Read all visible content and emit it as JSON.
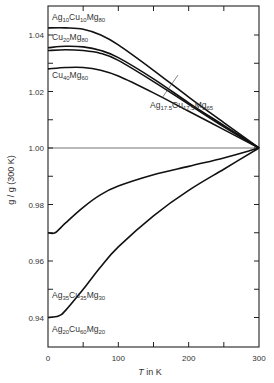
{
  "chart_data": {
    "type": "line",
    "title": "",
    "xlabel": "T in K",
    "ylabel": "g / g (300 K)",
    "xlim": [
      0,
      300
    ],
    "ylim": [
      0.93,
      1.045
    ],
    "x_ticks": [
      0,
      100,
      200,
      300
    ],
    "x_minor_ticks": [
      50,
      150,
      250
    ],
    "y_ticks": [
      0.94,
      0.96,
      0.98,
      1.0,
      1.02,
      1.04
    ],
    "y_minor_ticks": [
      0.95,
      0.97,
      0.99,
      1.01,
      1.03
    ],
    "reference_line": {
      "y": 1.0,
      "label": "g/g(300K) = 1"
    },
    "grid": false,
    "legend": "inline labels",
    "series": [
      {
        "name": "Ag10Cu10Mg80",
        "label_parts": [
          "Ag",
          "10",
          "Cu",
          "10",
          "Mg",
          "80"
        ],
        "x": [
          0,
          25,
          50,
          75,
          100,
          150,
          200,
          250,
          300
        ],
        "y": [
          1.0425,
          1.0425,
          1.042,
          1.04,
          1.0365,
          1.0275,
          1.018,
          1.009,
          1.0
        ]
      },
      {
        "name": "Cu20Mg80",
        "label_parts": [
          "Cu",
          "20",
          "Mg",
          "80"
        ],
        "x": [
          0,
          25,
          50,
          75,
          100,
          150,
          200,
          250,
          300
        ],
        "y": [
          1.0355,
          1.036,
          1.0358,
          1.0345,
          1.032,
          1.0245,
          1.016,
          1.008,
          1.0
        ]
      },
      {
        "name": "Ag17.5Cu17.5Mg65",
        "label_parts": [
          "Ag",
          "17.5",
          "Cu",
          "17.5",
          "Mg",
          "65"
        ],
        "x": [
          0,
          25,
          50,
          75,
          100,
          150,
          200,
          250,
          300
        ],
        "y": [
          1.0345,
          1.0348,
          1.0345,
          1.0335,
          1.031,
          1.0235,
          1.0155,
          1.0075,
          1.0
        ]
      },
      {
        "name": "Cu40Mg60",
        "label_parts": [
          "Cu",
          "40",
          "Mg",
          "60"
        ],
        "x": [
          0,
          25,
          50,
          75,
          100,
          150,
          200,
          250,
          300
        ],
        "y": [
          1.028,
          1.0285,
          1.0285,
          1.0275,
          1.0255,
          1.0195,
          1.013,
          1.0065,
          1.0
        ]
      },
      {
        "name": "Ag35Cu35Mg30",
        "label_parts": [
          "Ag",
          "35",
          "Cu",
          "35",
          "Mg",
          "30"
        ],
        "x": [
          0,
          10,
          25,
          50,
          75,
          100,
          150,
          200,
          250,
          300
        ],
        "y": [
          0.97,
          0.97,
          0.9735,
          0.979,
          0.9835,
          0.9865,
          0.9905,
          0.9935,
          0.9965,
          1.0
        ]
      },
      {
        "name": "Ag20Cu60Mg20",
        "label_parts": [
          "Ag",
          "20",
          "Cu",
          "60",
          "Mg",
          "20"
        ],
        "x": [
          0,
          15,
          25,
          50,
          75,
          100,
          150,
          200,
          250,
          300
        ],
        "y": [
          0.94,
          0.9405,
          0.9425,
          0.95,
          0.958,
          0.965,
          0.976,
          0.985,
          0.9925,
          1.0
        ]
      }
    ]
  },
  "labels": {
    "x_axis_title_italic": "T",
    "x_axis_title_rest": " in K",
    "y_axis_title": "g / g (300 K)"
  }
}
